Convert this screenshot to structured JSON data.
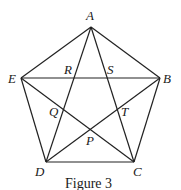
{
  "figure": {
    "caption": "Figure 3",
    "vertices": {
      "A": {
        "label": "A",
        "x": 91,
        "y": 27
      },
      "B": {
        "label": "B",
        "x": 160,
        "y": 78
      },
      "C": {
        "label": "C",
        "x": 134,
        "y": 162
      },
      "D": {
        "label": "D",
        "x": 46,
        "y": 162
      },
      "E": {
        "label": "E",
        "x": 21,
        "y": 78
      }
    },
    "intersections": {
      "R": {
        "label": "R"
      },
      "S": {
        "label": "S"
      },
      "T": {
        "label": "T"
      },
      "P": {
        "label": "P"
      },
      "Q": {
        "label": "Q"
      }
    },
    "sides": [
      "AB",
      "BC",
      "CD",
      "DE",
      "EA"
    ],
    "diagonals": [
      "AC",
      "AD",
      "BD",
      "BE",
      "CE"
    ]
  }
}
